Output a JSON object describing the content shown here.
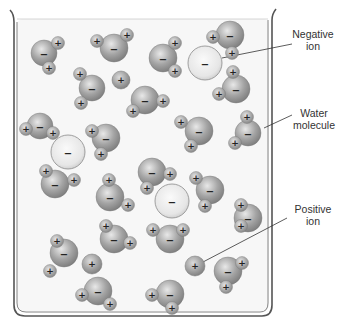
{
  "diagram": {
    "labels": {
      "negative_ion": [
        "Negative",
        "ion"
      ],
      "water_molecule": [
        "Water",
        "molecule"
      ],
      "positive_ion": [
        "Positive",
        "ion"
      ]
    },
    "symbols": {
      "positive": "+",
      "negative": "−"
    },
    "colors": {
      "beaker_stroke": "#555555",
      "liquid_fill": "#f7f7f7",
      "oxygen": "#9a9a9a",
      "hydrogen": "#a8a8a8",
      "negative_ion": "#e6e6e6",
      "positive_ion": "#a0a0a0",
      "leader_line": "#333333",
      "text": "#333333"
    },
    "water_molecules": [
      {
        "o": [
          44,
          53,
          13
        ],
        "h": [
          [
            58,
            43
          ],
          [
            49,
            68
          ]
        ]
      },
      {
        "o": [
          114,
          48,
          14
        ],
        "h": [
          [
            97,
            41
          ],
          [
            127,
            35
          ]
        ]
      },
      {
        "o": [
          163,
          58,
          14
        ],
        "h": [
          [
            175,
            43
          ],
          [
            175,
            71
          ]
        ]
      },
      {
        "o": [
          230,
          35,
          14
        ],
        "h": [
          [
            213,
            37
          ],
          [
            232,
            53
          ]
        ]
      },
      {
        "o": [
          236,
          89,
          14
        ],
        "h": [
          [
            233,
            72
          ],
          [
            219,
            94
          ]
        ]
      },
      {
        "o": [
          92,
          88,
          13
        ],
        "h": [
          [
            80,
            74
          ],
          [
            81,
            103
          ]
        ]
      },
      {
        "o": [
          145,
          100,
          14
        ],
        "h": [
          [
            163,
            101
          ],
          [
            133,
            111
          ]
        ]
      },
      {
        "o": [
          40,
          126,
          13
        ],
        "h": [
          [
            26,
            129
          ],
          [
            53,
            133
          ]
        ]
      },
      {
        "o": [
          106,
          138,
          14
        ],
        "h": [
          [
            92,
            131
          ],
          [
            101,
            154
          ]
        ]
      },
      {
        "o": [
          199,
          131,
          14
        ],
        "h": [
          [
            181,
            122
          ],
          [
            191,
            146
          ]
        ]
      },
      {
        "o": [
          248,
          133,
          13
        ],
        "h": [
          [
            247,
            117
          ],
          [
            235,
            143
          ]
        ]
      },
      {
        "o": [
          55,
          184,
          14
        ],
        "h": [
          [
            46,
            171
          ],
          [
            74,
            180
          ]
        ]
      },
      {
        "o": [
          110,
          197,
          14
        ],
        "h": [
          [
            109,
            180
          ],
          [
            128,
            205
          ]
        ]
      },
      {
        "o": [
          152,
          172,
          14
        ],
        "h": [
          [
            170,
            174
          ],
          [
            147,
            188
          ]
        ]
      },
      {
        "o": [
          210,
          190,
          14
        ],
        "h": [
          [
            196,
            178
          ],
          [
            205,
            206
          ]
        ]
      },
      {
        "o": [
          248,
          218,
          14
        ],
        "h": [
          [
            241,
            205
          ],
          [
            241,
            226
          ]
        ]
      },
      {
        "o": [
          64,
          253,
          14
        ],
        "h": [
          [
            57,
            241
          ],
          [
            50,
            271
          ]
        ]
      },
      {
        "o": [
          114,
          239,
          14
        ],
        "h": [
          [
            106,
            226
          ],
          [
            130,
            243
          ]
        ]
      },
      {
        "o": [
          170,
          239,
          14
        ],
        "h": [
          [
            153,
            230
          ],
          [
            183,
            230
          ]
        ]
      },
      {
        "o": [
          228,
          271,
          14
        ],
        "h": [
          [
            242,
            263
          ],
          [
            226,
            287
          ]
        ]
      },
      {
        "o": [
          98,
          291,
          14
        ],
        "h": [
          [
            82,
            295
          ],
          [
            110,
            304
          ]
        ]
      },
      {
        "o": [
          170,
          294,
          14
        ],
        "h": [
          [
            152,
            295
          ],
          [
            172,
            308
          ]
        ]
      }
    ],
    "negative_ions": [
      [
        205,
        63,
        17
      ],
      [
        68,
        152,
        17
      ],
      [
        172,
        201,
        17
      ]
    ],
    "positive_ions": [
      [
        121,
        80,
        9
      ],
      [
        92,
        264,
        10
      ],
      [
        195,
        266,
        10
      ]
    ],
    "leaders": [
      {
        "from": [
          222,
          58
        ],
        "to": [
          292,
          44
        ]
      },
      {
        "from": [
          264,
          128
        ],
        "to": [
          292,
          115
        ]
      },
      {
        "from": [
          203,
          262
        ],
        "to": [
          287,
          218
        ]
      }
    ]
  }
}
